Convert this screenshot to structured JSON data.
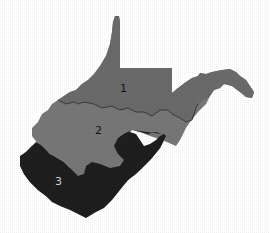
{
  "map": {
    "subject": "West Virginia",
    "regions": [
      {
        "id": "1",
        "label": "1",
        "color": "#6e6e6e"
      },
      {
        "id": "2",
        "label": "2",
        "color": "#777777"
      },
      {
        "id": "3",
        "label": "3",
        "color": "#1e1e1e"
      }
    ],
    "boundary_line_color": "#2a2a2a",
    "background": "#ffffff"
  }
}
